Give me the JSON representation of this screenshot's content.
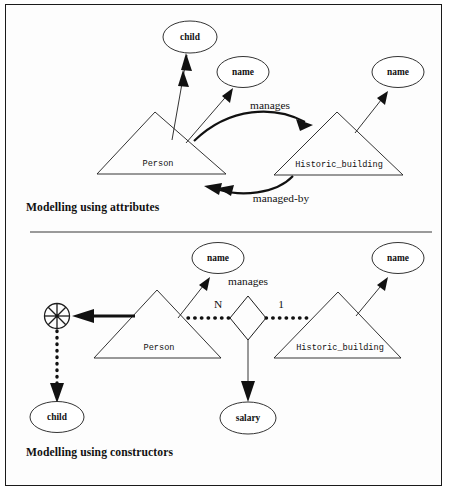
{
  "figure": {
    "background_color": "#ffffff",
    "frame_color": "#1a1a1a",
    "divider_color": "#9a9a9a",
    "ink_color": "#111111"
  },
  "panels": [
    {
      "id": "attributes",
      "caption": "Modelling using attributes",
      "entities": [
        {
          "name": "entity-person",
          "label": "Person"
        },
        {
          "name": "entity-historic-building",
          "label": "Historic_building"
        }
      ],
      "attributes": [
        {
          "name": "attribute-child",
          "label": "child",
          "multivalued": true
        },
        {
          "name": "attribute-name-person",
          "label": "name",
          "multivalued": false
        },
        {
          "name": "attribute-name-building",
          "label": "name",
          "multivalued": false
        }
      ],
      "relationships": [
        {
          "name": "relationship-manages",
          "label": "manages",
          "direction": "person-to-building",
          "multivalued": false
        },
        {
          "name": "relationship-managed-by",
          "label": "managed-by",
          "direction": "building-to-person",
          "multivalued": true
        }
      ]
    },
    {
      "id": "constructors",
      "caption": "Modelling using constructors",
      "entities": [
        {
          "name": "entity-person",
          "label": "Person"
        },
        {
          "name": "entity-historic-building",
          "label": "Historic_building"
        }
      ],
      "attributes": [
        {
          "name": "attribute-name-person",
          "label": "name"
        },
        {
          "name": "attribute-name-building",
          "label": "name"
        },
        {
          "name": "attribute-salary",
          "label": "salary"
        },
        {
          "name": "attribute-child",
          "label": "child"
        }
      ],
      "constructors": [
        {
          "name": "set-constructor",
          "symbol": "set-constructor-icon",
          "spokes": 8
        }
      ],
      "relationships": [
        {
          "name": "relationship-manages",
          "label": "manages",
          "shape": "diamond"
        }
      ],
      "cardinalities": [
        {
          "name": "cardinality-person-side",
          "label": "N"
        },
        {
          "name": "cardinality-building-side",
          "label": "1"
        }
      ]
    }
  ]
}
